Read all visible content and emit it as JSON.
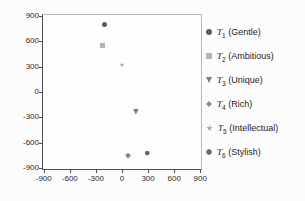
{
  "chart_data": {
    "type": "scatter",
    "title": "",
    "xlabel": "",
    "ylabel": "",
    "xlim": [
      -900,
      900
    ],
    "ylim": [
      -900,
      900
    ],
    "x_ticks": [
      -900,
      -600,
      -300,
      0,
      300,
      600,
      900
    ],
    "y_ticks": [
      900,
      600,
      300,
      0,
      -300,
      -600,
      -900
    ],
    "grid": false,
    "legend_position": "right",
    "series": [
      {
        "name": "T1",
        "symbol": "T",
        "sub": "1",
        "label_suffix": "(Gentle)",
        "legend_text": "T1 (Gentle)",
        "marker": "circle",
        "color": "#5c5c5c",
        "points": [
          [
            -200,
            800
          ]
        ]
      },
      {
        "name": "T2",
        "symbol": "T",
        "sub": "2",
        "label_suffix": "(Ambitious)",
        "legend_text": "T2 (Ambitious)",
        "marker": "square",
        "color": "#b4b4b4",
        "points": [
          [
            -220,
            550
          ]
        ]
      },
      {
        "name": "T3",
        "symbol": "T",
        "sub": "3",
        "label_suffix": "(Unique)",
        "legend_text": "T3 (Unique)",
        "marker": "triangle-down",
        "color": "#7d7d7d",
        "points": [
          [
            160,
            -230
          ]
        ]
      },
      {
        "name": "T4",
        "symbol": "T",
        "sub": "4",
        "label_suffix": "(Rich)",
        "legend_text": "T4 (Rich)",
        "marker": "diamond",
        "color": "#8c8c8c",
        "points": [
          [
            70,
            -750
          ]
        ]
      },
      {
        "name": "T5",
        "symbol": "T",
        "sub": "5",
        "label_suffix": "(Intellectual)",
        "legend_text": "T5 (Intellectual)",
        "marker": "star",
        "color": "#ababab",
        "points": [
          [
            0,
            320
          ]
        ]
      },
      {
        "name": "T6",
        "symbol": "T",
        "sub": "6",
        "label_suffix": "(Stylish)",
        "legend_text": "T6 (Stylish)",
        "marker": "hexagon",
        "color": "#636363",
        "points": [
          [
            290,
            -720
          ]
        ]
      }
    ]
  },
  "colors": {
    "axis_dark": "#4f4f4f",
    "axis_light": "#b8b8b8",
    "tick_label": "#2b2b2b",
    "legend_text": "#1d1d1d",
    "background": "#fcfcfc"
  }
}
